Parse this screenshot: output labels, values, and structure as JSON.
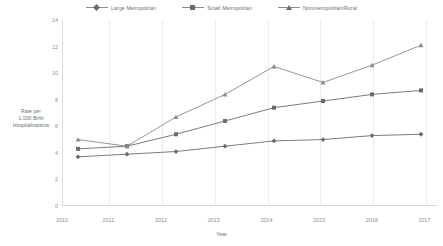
{
  "chart_data": {
    "type": "line",
    "title": "",
    "xlabel": "Year",
    "ylabel": "Rate per 1,000 Birth Hospitalizations",
    "categories": [
      "2010",
      "2011",
      "2012",
      "2013",
      "2014",
      "2015",
      "2016",
      "2017"
    ],
    "ylim": [
      0,
      14
    ],
    "yticks": [
      0,
      2,
      4,
      6,
      8,
      10,
      12,
      14
    ],
    "grid": "vertical",
    "legend_position": "top-center",
    "series": [
      {
        "name": "Large Metropolitan",
        "marker": "diamond",
        "color": "#6b6b6b",
        "values": [
          3.7,
          3.9,
          4.1,
          4.5,
          4.9,
          5.0,
          5.3,
          5.4
        ]
      },
      {
        "name": "Small Metropolitan",
        "marker": "square",
        "color": "#6b6b6b",
        "values": [
          4.3,
          4.5,
          5.4,
          6.4,
          7.4,
          7.9,
          8.4,
          8.7
        ]
      },
      {
        "name": "Nonmetropolitan/Rural",
        "marker": "triangle",
        "color": "#8a8a8a",
        "values": [
          5.0,
          4.5,
          6.7,
          8.4,
          10.5,
          9.3,
          10.6,
          12.1
        ]
      }
    ]
  },
  "legend": {
    "items": [
      {
        "label": "Large Metropolitan"
      },
      {
        "label": "Small Metropolitan"
      },
      {
        "label": "Nonmetropolitan/Rural"
      }
    ]
  },
  "axes": {
    "y_title": "Rate per\n1,000 Birth\nHospitalizations",
    "y_title_line1": "Rate per",
    "y_title_line2": "1,000 Birth",
    "y_title_line3": "Hospitalizations",
    "x_title": "Year"
  }
}
